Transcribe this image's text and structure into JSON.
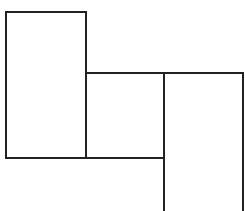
{
  "diagram": {
    "stroke_color": "#222222",
    "stroke_width": 2,
    "shapes": [
      {
        "name": "left-rectangle",
        "x": 6,
        "y": 12,
        "w": 80,
        "h": 146
      },
      {
        "name": "middle-square",
        "x": 86,
        "y": 73,
        "w": 78,
        "h": 85
      },
      {
        "name": "right-rectangle-open-bottom",
        "x": 164,
        "y": 73,
        "w": 79,
        "h": 138
      }
    ]
  }
}
